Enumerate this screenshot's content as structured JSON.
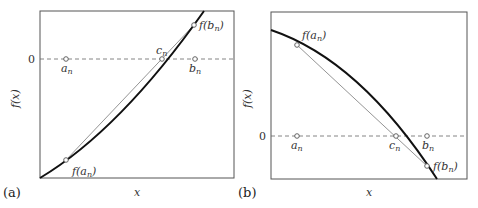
{
  "figure": {
    "panels": [
      {
        "id": "a",
        "panel_label": "(a)",
        "xlabel": "x",
        "ylabel": "f(x)",
        "zero_label": "0",
        "curve": "convex increasing",
        "points": {
          "a_n": "a",
          "b_n": "b",
          "c_n": "c",
          "f_a_n": "f(a",
          "f_b_n": "f(b",
          "subscript": "n",
          "close": ")"
        }
      },
      {
        "id": "b",
        "panel_label": "(b)",
        "xlabel": "x",
        "ylabel": "f(x)",
        "zero_label": "0",
        "curve": "concave decreasing",
        "points": {
          "a_n": "a",
          "b_n": "b",
          "c_n": "c",
          "f_a_n": "f(a",
          "f_b_n": "f(b",
          "subscript": "n",
          "close": ")"
        }
      }
    ],
    "colors": {
      "frame": "#555555",
      "curve": "#111111",
      "chord": "#888888",
      "zero_line": "#666666",
      "marker": "#555555"
    }
  }
}
